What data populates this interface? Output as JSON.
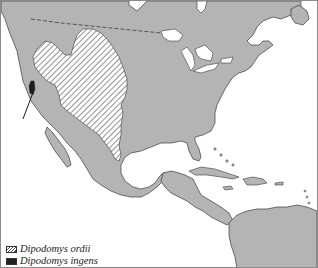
{
  "map": {
    "title": "",
    "region": "North and Central America",
    "colors": {
      "land": "#b4b4b4",
      "water": "#ffffff",
      "coastline": "#3a3a3a",
      "border": "#3a3a3a",
      "hatch": "#4a4a4a",
      "ingens": "#1e1e1e"
    },
    "ranges": [
      {
        "species": "Dipodomys ordii",
        "style": "hatched"
      },
      {
        "species": "Dipodomys ingens",
        "style": "solid",
        "pointer": "arrow"
      }
    ]
  },
  "legend": {
    "items": [
      {
        "label": "Dipodomys ordii",
        "swatch": "hatched"
      },
      {
        "label": "Dipodomys ingens",
        "swatch": "solid"
      }
    ]
  }
}
